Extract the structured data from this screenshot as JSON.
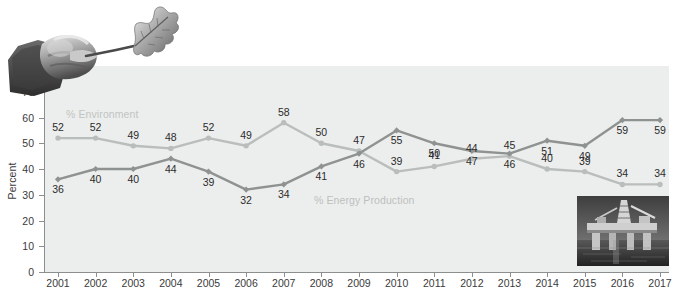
{
  "chart_data": {
    "type": "line",
    "title": "",
    "subtitle": "",
    "xlabel": "",
    "ylabel": "Percent",
    "ylim": [
      0,
      80
    ],
    "ytick_step": 10,
    "yticks": [
      0,
      10,
      20,
      30,
      40,
      50,
      60,
      70,
      80
    ],
    "grid": false,
    "legend_position": "inline-annotations",
    "categories": [
      "2001",
      "2002",
      "2003",
      "2004",
      "2005",
      "2006",
      "2007",
      "2008",
      "2009",
      "2010",
      "2011",
      "2012",
      "2013",
      "2014",
      "2015",
      "2016",
      "2017"
    ],
    "series": [
      {
        "name": "% Environment",
        "color": "#b9bdbb",
        "marker": "circle",
        "label_side": "above",
        "values": [
          52,
          52,
          49,
          48,
          52,
          49,
          58,
          50,
          47,
          39,
          41,
          44,
          45,
          40,
          39,
          34,
          34
        ]
      },
      {
        "name": "% Energy Production",
        "color": "#8e9290",
        "marker": "diamond",
        "label_side": "below",
        "values": [
          36,
          40,
          40,
          44,
          39,
          32,
          34,
          41,
          46,
          55,
          50,
          47,
          46,
          51,
          49,
          59,
          59
        ]
      }
    ],
    "annotations": [
      {
        "text": "% Environment",
        "series": "% Environment"
      },
      {
        "text": "% Energy Production",
        "series": "% Energy Production"
      }
    ],
    "value_labels": {
      "environment": [
        "52",
        "52",
        "49",
        "48",
        "52",
        "49",
        "58",
        "50",
        "47",
        "39",
        "41",
        "44",
        "45",
        "40",
        "39",
        "34",
        "34"
      ],
      "energy": [
        "36",
        "40",
        "40",
        "44",
        "39",
        "32",
        "34",
        "41",
        "46",
        "55",
        "50",
        "47",
        "46",
        "51",
        "49",
        "59",
        "59"
      ]
    },
    "images": [
      {
        "name": "hand-holding-leaf-photo",
        "position": "top-left",
        "style": "grayscale-photograph"
      },
      {
        "name": "offshore-oil-rig-photo",
        "position": "bottom-right",
        "style": "grayscale-photograph"
      }
    ]
  },
  "axis": {
    "y_title": "Percent",
    "y_tick_labels": [
      "0",
      "10",
      "20",
      "30",
      "40",
      "50",
      "60",
      "70",
      "80"
    ],
    "x_tick_labels": [
      "2001",
      "2002",
      "2003",
      "2004",
      "2005",
      "2006",
      "2007",
      "2008",
      "2009",
      "2010",
      "2011",
      "2012",
      "2013",
      "2014",
      "2015",
      "2016",
      "2017"
    ]
  },
  "colors": {
    "plot_background": "#eceeed",
    "axis": "#8d8f8e",
    "series_environment": "#b9bdbb",
    "series_energy": "#8e9290",
    "text": "#2b2b2b",
    "annotation_text": "#c0c4c2"
  }
}
